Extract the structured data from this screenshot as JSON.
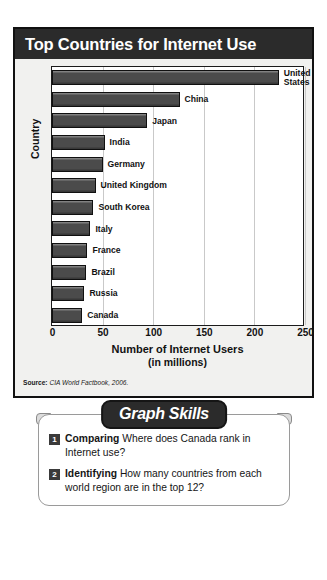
{
  "figure": {
    "title": "Top Countries for Internet Use",
    "source_label": "Source:",
    "source_text": "CIA World Factbook, 2006."
  },
  "chart_data": {
    "type": "bar",
    "orientation": "horizontal",
    "title": "Top Countries for Internet Use",
    "xlabel": "Number of Internet Users",
    "xlabel_sub": "(in millions)",
    "ylabel": "Country",
    "xlim": [
      0,
      250
    ],
    "xticks": [
      0,
      50,
      100,
      150,
      200,
      250
    ],
    "grid": true,
    "legend": "none",
    "categories": [
      "United States",
      "China",
      "Japan",
      "India",
      "Germany",
      "United Kingdom",
      "South Korea",
      "Italy",
      "France",
      "Brazil",
      "Russia",
      "Canada"
    ],
    "values": [
      224,
      126,
      94,
      52,
      50,
      43,
      41,
      38,
      35,
      34,
      32,
      30
    ],
    "bar_fill": "#4b4b4b",
    "bar_stroke": "#101010"
  },
  "skills": {
    "banner": "Graph Skills",
    "questions": [
      {
        "number": "1",
        "term": "Comparing",
        "text": "Where does Canada rank in Internet use?"
      },
      {
        "number": "2",
        "term": "Identifying",
        "text": "How many countries from each world region are in the top 12?"
      }
    ]
  }
}
